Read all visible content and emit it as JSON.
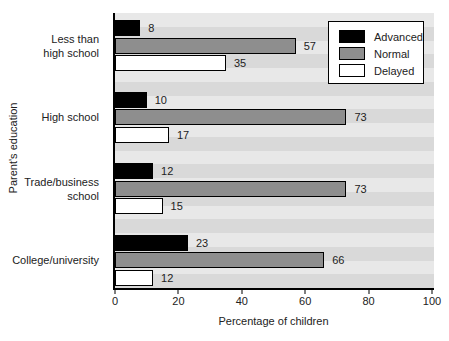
{
  "chart_data": {
    "type": "bar",
    "orientation": "horizontal",
    "title": "",
    "categories": [
      "Less than high school",
      "High school",
      "Trade/business school",
      "College/university"
    ],
    "category_label_lines": [
      [
        "Less than",
        "high school"
      ],
      [
        "High school"
      ],
      [
        "Trade/business",
        "school"
      ],
      [
        "College/university"
      ]
    ],
    "series": [
      {
        "name": "Advanced",
        "color": "#000000",
        "values": [
          8,
          10,
          12,
          23
        ]
      },
      {
        "name": "Normal",
        "color": "#8e8e8e",
        "values": [
          57,
          73,
          73,
          66
        ]
      },
      {
        "name": "Delayed",
        "color": "#ffffff",
        "values": [
          35,
          17,
          15,
          12
        ]
      }
    ],
    "value_labels_shown": true,
    "xlabel": "Percentage of children",
    "ylabel": "Parent's education",
    "xlim": [
      0,
      100
    ],
    "xticks": [
      0,
      20,
      40,
      60,
      80,
      100
    ],
    "legend_position": "top-right-inside",
    "grid": false,
    "background_stripes": [
      "#e8e8e8",
      "#d9d9d9"
    ]
  }
}
